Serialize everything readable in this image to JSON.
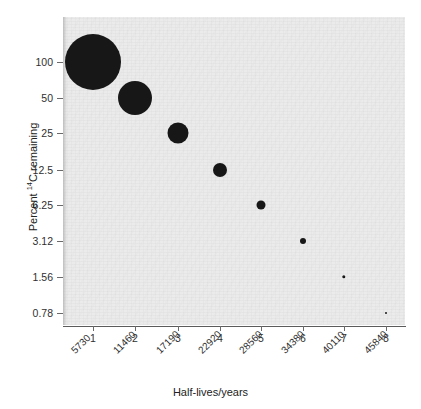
{
  "chart_data": {
    "type": "scatter",
    "title": "",
    "xlabel": "Half-lives/years",
    "ylabel": "Percent 14C remaining",
    "ylabel_parts": {
      "prefix": "Percent ",
      "superscript": "14",
      "suffix": "C remaining"
    },
    "grid": false,
    "legend": null,
    "x_tick_labels": [
      "1",
      "2",
      "3",
      "4",
      "5",
      "6",
      "7",
      "8"
    ],
    "x_secondary_tick_labels": [
      "5730",
      "11460",
      "17190",
      "22920",
      "28560",
      "34380",
      "40110",
      "45840"
    ],
    "y_tick_labels": [
      "100",
      "50",
      "25",
      "12.5",
      "6.25",
      "3.12",
      "1.56",
      "0.78"
    ],
    "x": [
      1,
      2,
      3,
      4,
      5,
      6,
      7,
      8
    ],
    "years": [
      5730,
      11460,
      17190,
      22920,
      28560,
      34380,
      40110,
      45840
    ],
    "values": [
      100,
      50,
      25,
      12.5,
      6.25,
      3.12,
      1.56,
      0.78
    ],
    "marker_sizes_px": [
      56,
      34,
      21,
      14,
      9,
      6,
      3.4,
      2
    ],
    "marker_color": "#171717",
    "panel_color": "#ebebeb",
    "yscale": "log2-like category",
    "points": [
      {
        "x": 1,
        "years": 5730,
        "percent": 100,
        "px": 93,
        "py": 62,
        "r": 28
      },
      {
        "x": 2,
        "years": 11460,
        "percent": 50,
        "px": 135,
        "py": 98,
        "r": 17
      },
      {
        "x": 3,
        "years": 17190,
        "percent": 25,
        "px": 178,
        "py": 133,
        "r": 10.5
      },
      {
        "x": 4,
        "years": 22920,
        "percent": 12.5,
        "px": 220,
        "py": 170,
        "r": 7
      },
      {
        "x": 5,
        "years": 28560,
        "percent": 6.25,
        "px": 261,
        "py": 205,
        "r": 4.5
      },
      {
        "x": 6,
        "years": 34380,
        "percent": 3.12,
        "px": 303,
        "py": 241,
        "r": 3
      },
      {
        "x": 7,
        "years": 40110,
        "percent": 1.56,
        "px": 344,
        "py": 277,
        "r": 1.7
      },
      {
        "x": 8,
        "years": 45840,
        "percent": 0.78,
        "px": 386,
        "py": 313,
        "r": 1
      }
    ]
  },
  "axes": {
    "y_ticks": [
      {
        "label": "100",
        "py": 62
      },
      {
        "label": "50",
        "py": 98
      },
      {
        "label": "25",
        "py": 133
      },
      {
        "label": "12.5",
        "py": 170
      },
      {
        "label": "6.25",
        "py": 205
      },
      {
        "label": "3.12",
        "py": 241
      },
      {
        "label": "1.56",
        "py": 277
      },
      {
        "label": "0.78",
        "py": 313
      }
    ],
    "x_ticks": [
      {
        "label": "1",
        "year": "5730",
        "px": 93
      },
      {
        "label": "2",
        "year": "11460",
        "px": 135
      },
      {
        "label": "3",
        "year": "17190",
        "px": 178
      },
      {
        "label": "4",
        "year": "22920",
        "px": 220
      },
      {
        "label": "5",
        "year": "28560",
        "px": 261
      },
      {
        "label": "6",
        "year": "34380",
        "px": 303
      },
      {
        "label": "7",
        "year": "40110",
        "px": 344
      },
      {
        "label": "8",
        "year": "45840",
        "px": 386
      }
    ]
  },
  "titles": {
    "x_axis": "Half-lives/years",
    "y_axis_prefix": "Percent ",
    "y_axis_superscript": "14",
    "y_axis_suffix": "C remaining"
  }
}
